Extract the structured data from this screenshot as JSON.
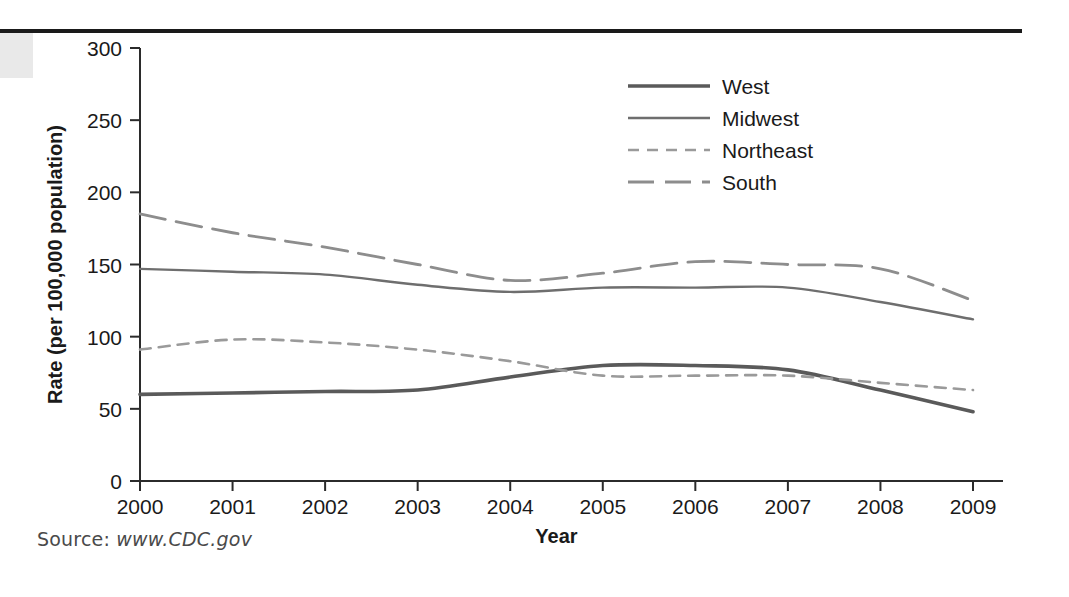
{
  "figure": {
    "source_prefix": "Source: ",
    "source_url": "www.CDC.gov"
  },
  "chart_data": {
    "type": "line",
    "title": "",
    "xlabel": "Year",
    "ylabel": "Rate (per 100,000 population)",
    "x": [
      2000,
      2001,
      2002,
      2003,
      2004,
      2005,
      2006,
      2007,
      2008,
      2009
    ],
    "xtick_labels": [
      "2000",
      "2001",
      "2002",
      "2003",
      "2004",
      "2005",
      "2006",
      "2007",
      "2008",
      "2009"
    ],
    "ytick_labels": [
      "0",
      "50",
      "100",
      "150",
      "200",
      "250",
      "300"
    ],
    "yticks": [
      0,
      50,
      100,
      150,
      200,
      250,
      300
    ],
    "xlim": [
      2000,
      2009
    ],
    "ylim": [
      0,
      300
    ],
    "grid": false,
    "legend_position": "top-right",
    "series": [
      {
        "name": "West",
        "style": "solid-thick",
        "color": "#5a5a5a",
        "values": [
          60,
          61,
          62,
          63,
          72,
          80,
          80,
          77,
          63,
          48
        ]
      },
      {
        "name": "Midwest",
        "style": "solid-thin",
        "color": "#6e6e6e",
        "values": [
          147,
          145,
          143,
          136,
          131,
          134,
          134,
          134,
          124,
          112
        ]
      },
      {
        "name": "Northeast",
        "style": "dashed-short",
        "color": "#9a9a9a",
        "values": [
          91,
          98,
          96,
          91,
          83,
          73,
          73,
          73,
          68,
          63
        ]
      },
      {
        "name": "South",
        "style": "dashed-long",
        "color": "#8d8d8d",
        "values": [
          185,
          172,
          162,
          150,
          139,
          144,
          152,
          150,
          147,
          125
        ]
      }
    ]
  }
}
